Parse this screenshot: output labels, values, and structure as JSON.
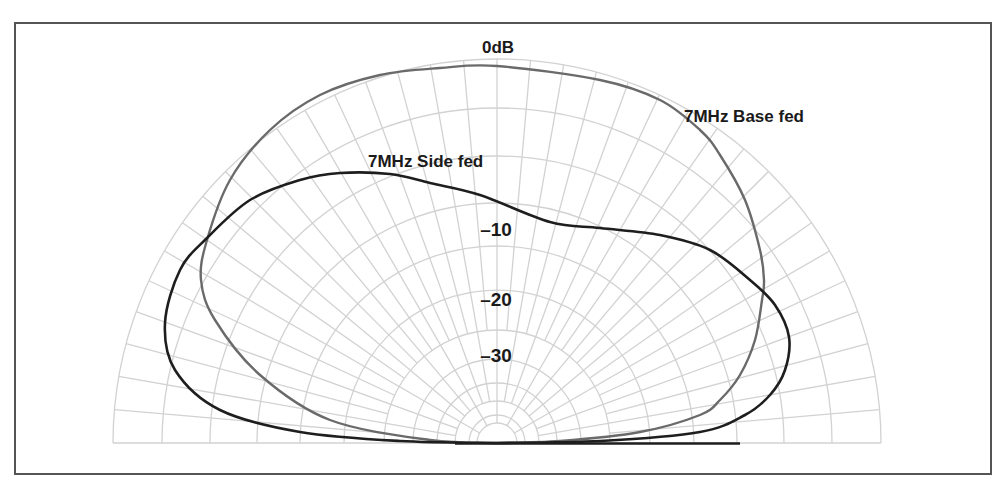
{
  "chart_data": {
    "type": "polar",
    "subtype": "elevation-pattern",
    "title": "",
    "radial_axis": {
      "unit": "dB",
      "tick_labels": [
        "0dB",
        "-10",
        "-20",
        "-30"
      ],
      "ring_levels_db": [
        0,
        -3,
        -6,
        -10,
        -15,
        -20,
        -25,
        -30,
        -35,
        -40,
        -45,
        -50
      ]
    },
    "angular_axis": {
      "range_deg": [
        0,
        180
      ],
      "spoke_step_deg": 5
    },
    "series": [
      {
        "name": "7MHz Base fed",
        "color": "#6a6a6a",
        "shape_points_px": [
          [
            497,
            443
          ],
          [
            430,
            440
          ],
          [
            330,
            420
          ],
          [
            260,
            375
          ],
          [
            215,
            320
          ],
          [
            201,
            280
          ],
          [
            207,
            240
          ],
          [
            230,
            180
          ],
          [
            270,
            130
          ],
          [
            320,
            95
          ],
          [
            380,
            75
          ],
          [
            440,
            68
          ],
          [
            497,
            66
          ],
          [
            600,
            80
          ],
          [
            660,
            100
          ],
          [
            700,
            130
          ],
          [
            720,
            155
          ],
          [
            745,
            200
          ],
          [
            760,
            250
          ],
          [
            764,
            280
          ],
          [
            762,
            300
          ],
          [
            755,
            340
          ],
          [
            740,
            375
          ],
          [
            720,
            400
          ],
          [
            700,
            415
          ],
          [
            640,
            432
          ],
          [
            560,
            441
          ],
          [
            497,
            443
          ]
        ]
      },
      {
        "name": "7MHz Side fed",
        "color": "#1e1e1e",
        "shape_points_px": [
          [
            497,
            443
          ],
          [
            400,
            441
          ],
          [
            300,
            432
          ],
          [
            220,
            410
          ],
          [
            175,
            370
          ],
          [
            165,
            323
          ],
          [
            180,
            270
          ],
          [
            207,
            238
          ],
          [
            250,
            200
          ],
          [
            300,
            180
          ],
          [
            340,
            173
          ],
          [
            390,
            174
          ],
          [
            430,
            183
          ],
          [
            480,
            195
          ],
          [
            550,
            222
          ],
          [
            600,
            228
          ],
          [
            660,
            235
          ],
          [
            710,
            250
          ],
          [
            750,
            280
          ],
          [
            775,
            305
          ],
          [
            789,
            337
          ],
          [
            785,
            370
          ],
          [
            770,
            395
          ],
          [
            745,
            415
          ],
          [
            700,
            432
          ],
          [
            600,
            441
          ],
          [
            497,
            443
          ]
        ]
      }
    ],
    "annotations": [
      {
        "text": "0dB",
        "x": 498,
        "y": 52
      },
      {
        "text": "7MHz Base fed",
        "x": 750,
        "y": 120
      },
      {
        "text": "7MHz Side fed",
        "x": 430,
        "y": 166
      },
      {
        "text": "-10",
        "x": 490,
        "y": 236
      },
      {
        "text": "-20",
        "x": 490,
        "y": 306
      },
      {
        "text": "-30",
        "x": 490,
        "y": 362
      }
    ],
    "grid": true,
    "legend": "inline labels"
  },
  "labels": {
    "zero_db": "0dB",
    "base_fed": "7MHz Base fed",
    "side_fed": "7MHz Side fed",
    "minus10": "–10",
    "minus20": "–20",
    "minus30": "–30"
  }
}
